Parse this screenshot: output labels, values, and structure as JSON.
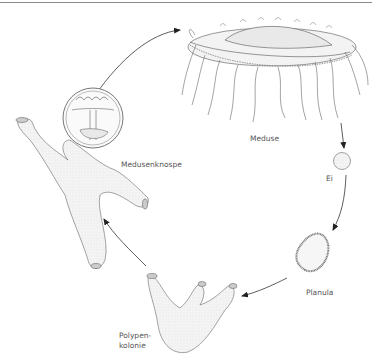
{
  "diagram": {
    "type": "life-cycle",
    "stages": [
      {
        "id": "meduse",
        "label": "Meduse"
      },
      {
        "id": "ei",
        "label": "Ei"
      },
      {
        "id": "planula",
        "label": "Planula"
      },
      {
        "id": "polypenkolonie",
        "label": "Polypen-\nkolonie",
        "label_lines": [
          "Polypen-",
          "kolonie"
        ]
      },
      {
        "id": "medusenknospe",
        "label": "Medusenknospe"
      }
    ],
    "flow": [
      {
        "from": "meduse",
        "to": "ei"
      },
      {
        "from": "ei",
        "to": "planula"
      },
      {
        "from": "planula",
        "to": "polypenkolonie"
      },
      {
        "from": "polypenkolonie",
        "to": "medusenknospe"
      },
      {
        "from": "medusenknospe",
        "to": "meduse"
      }
    ],
    "colors": {
      "line": "#444444",
      "fill": "#f2f2f2",
      "label": "#555555",
      "rule": "#8a8a8a"
    }
  }
}
